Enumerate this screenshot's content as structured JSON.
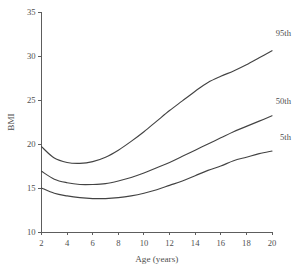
{
  "chart_data": {
    "type": "line",
    "title": "",
    "subtitle": "",
    "xlabel": "Age (years)",
    "ylabel": "BMI",
    "xlim": [
      2,
      20
    ],
    "ylim": [
      10,
      35
    ],
    "xticks": [
      2,
      4,
      6,
      8,
      10,
      12,
      14,
      16,
      18,
      20
    ],
    "yticks": [
      10,
      15,
      20,
      25,
      30,
      35
    ],
    "xtick_labels": [
      "2",
      "4",
      "6",
      "8",
      "10",
      "12",
      "14",
      "16",
      "18",
      "20"
    ],
    "ytick_labels": [
      "10",
      "15",
      "20",
      "25",
      "30",
      "35"
    ],
    "grid": false,
    "legend_position": "inline-right-end-labels",
    "line_color": "#434343",
    "axis_color": "#5d5d5d",
    "background_color": "#ffffff",
    "x": [
      2,
      3,
      4,
      5,
      6,
      7,
      8,
      9,
      10,
      11,
      12,
      13,
      14,
      15,
      16,
      17,
      18,
      19,
      20
    ],
    "series": [
      {
        "name": "95th",
        "label": "95th",
        "values": [
          19.7,
          18.4,
          17.9,
          17.8,
          18.0,
          18.5,
          19.3,
          20.3,
          21.4,
          22.6,
          23.8,
          24.9,
          26.0,
          27.0,
          27.7,
          28.3,
          29.0,
          29.8,
          30.6
        ]
      },
      {
        "name": "50th",
        "label": "50th",
        "values": [
          16.9,
          16.0,
          15.6,
          15.4,
          15.4,
          15.5,
          15.8,
          16.2,
          16.7,
          17.3,
          17.9,
          18.6,
          19.3,
          20.0,
          20.7,
          21.4,
          22.0,
          22.6,
          23.2
        ]
      },
      {
        "name": "5th",
        "label": "5th",
        "values": [
          15.0,
          14.4,
          14.1,
          13.9,
          13.8,
          13.8,
          13.9,
          14.1,
          14.4,
          14.8,
          15.3,
          15.8,
          16.4,
          17.0,
          17.5,
          18.1,
          18.5,
          18.9,
          19.2
        ]
      }
    ]
  },
  "axes": {
    "x_title": "Age (years)",
    "y_title": "BMI"
  }
}
